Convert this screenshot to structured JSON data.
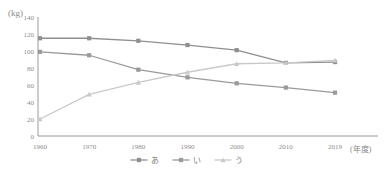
{
  "chart_data": {
    "type": "line",
    "title": "",
    "subtitle": "",
    "xlabel": "(年度)",
    "ylabel": "(kg)",
    "categories": [
      "1960",
      "1970",
      "1980",
      "1990",
      "2000",
      "2010",
      "2019"
    ],
    "x_tick_labels": [
      "1960",
      "1970",
      "1980",
      "1990",
      "2000",
      "2010",
      "2019"
    ],
    "y_tick_labels": [
      "140",
      "120",
      "100",
      "80",
      "60",
      "40",
      "20",
      "0"
    ],
    "y_ticks": [
      140,
      120,
      100,
      80,
      60,
      40,
      20,
      0
    ],
    "ylim": [
      0,
      140
    ],
    "grid": false,
    "legend_position": "bottom",
    "series": [
      {
        "name": "あ",
        "color": "#8f8f8f",
        "marker": "square",
        "values": [
          115,
          115,
          112,
          107,
          101,
          86,
          87
        ]
      },
      {
        "name": "い",
        "color": "#9a9a9a",
        "marker": "square",
        "values": [
          99,
          95,
          78,
          69,
          62,
          57,
          51
        ]
      },
      {
        "name": "う",
        "color": "#c9c9c9",
        "marker": "triangle",
        "values": [
          20,
          49,
          63,
          75,
          85,
          86,
          89
        ]
      }
    ]
  },
  "axis": {
    "y_unit_label": "(kg)",
    "x_unit_label": "(年度)"
  },
  "legend": {
    "items": [
      {
        "label": "あ",
        "color": "#8f8f8f"
      },
      {
        "label": "い",
        "color": "#9a9a9a"
      },
      {
        "label": "う",
        "color": "#c9c9c9"
      }
    ]
  }
}
